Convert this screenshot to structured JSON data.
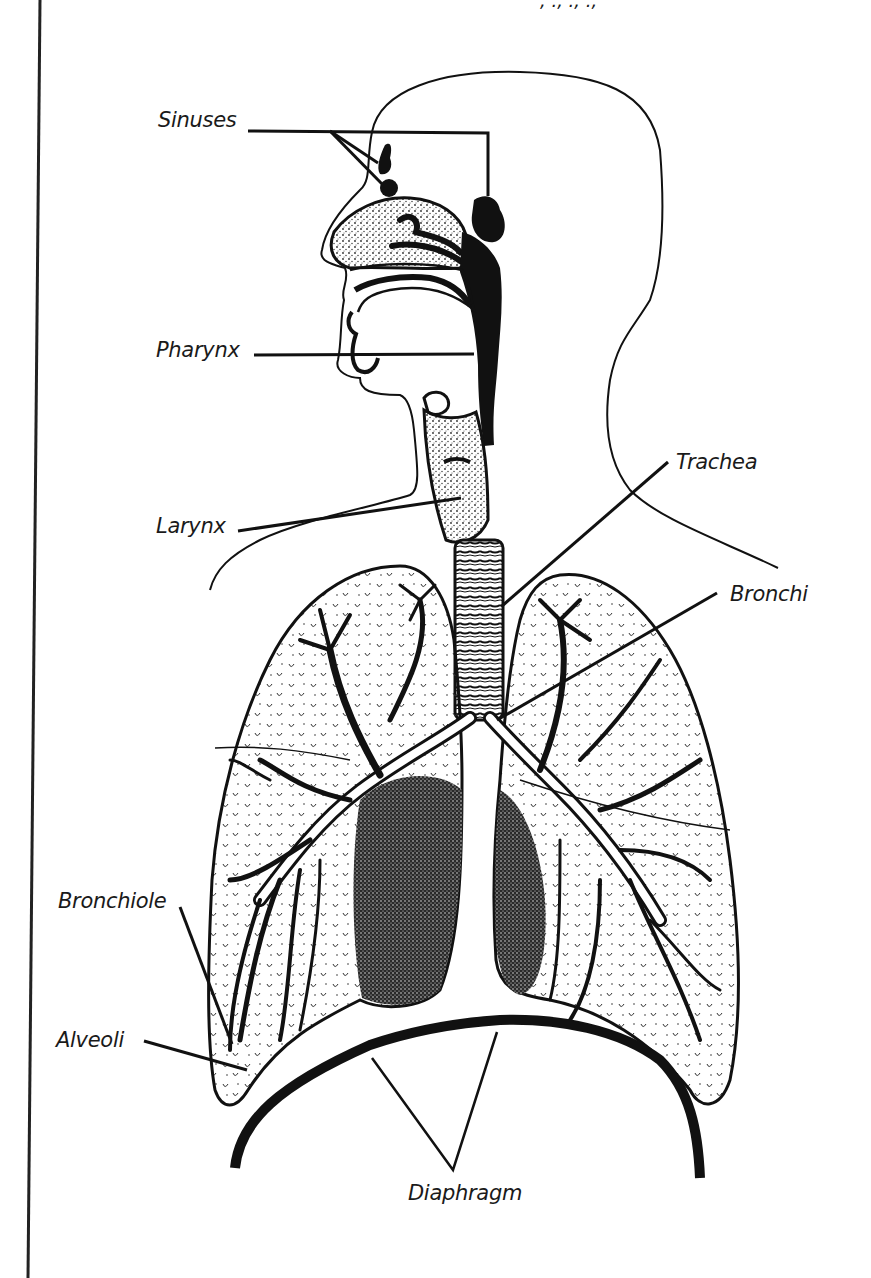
{
  "header_fragment": ", ., ., .,",
  "colors": {
    "ink": "#111111",
    "label": "#1a1a1a",
    "background": "#ffffff",
    "stipple": "#2a2a2a"
  },
  "labels": [
    {
      "id": "sinuses",
      "text": "Sinuses",
      "x": 158,
      "y": 110
    },
    {
      "id": "pharynx",
      "text": "Pharynx",
      "x": 156,
      "y": 340
    },
    {
      "id": "larynx",
      "text": "Larynx",
      "x": 156,
      "y": 516
    },
    {
      "id": "trachea",
      "text": "Trachea",
      "x": 676,
      "y": 452
    },
    {
      "id": "bronchi",
      "text": "Bronchi",
      "x": 730,
      "y": 584
    },
    {
      "id": "bronchiole",
      "text": "Bronchiole",
      "x": 58,
      "y": 891
    },
    {
      "id": "alveoli",
      "text": "Alveoli",
      "x": 56,
      "y": 1030
    },
    {
      "id": "diaphragm",
      "text": "Diaphragm",
      "x": 408,
      "y": 1183
    }
  ],
  "leader_lines": [
    {
      "for": "sinuses",
      "points": "248,131 488,133 488,196",
      "width": 3
    },
    {
      "for": "sinuses",
      "points": "330,131 385,187",
      "width": 3
    },
    {
      "for": "sinuses",
      "points": "330,131 378,163",
      "width": 3
    },
    {
      "for": "pharynx",
      "points": "254,355 474,354",
      "width": 3
    },
    {
      "for": "larynx",
      "points": "238,531 461,498",
      "width": 3
    },
    {
      "for": "trachea",
      "points": "668,462 502,606",
      "width": 3
    },
    {
      "for": "bronchi",
      "points": "717,593 497,720",
      "width": 3
    },
    {
      "for": "bronchiole",
      "points": "180,907 232,1044",
      "width": 3
    },
    {
      "for": "alveoli",
      "points": "144,1041 247,1070",
      "width": 3
    },
    {
      "for": "diaphragm",
      "points": "372,1058 453,1170 497,1032",
      "width": 2.5
    }
  ],
  "border": {
    "x1": 40,
    "y1": 0,
    "x2": 28,
    "y2": 1278
  }
}
